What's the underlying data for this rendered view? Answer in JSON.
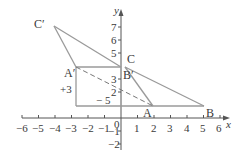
{
  "figure": {
    "type": "coordinate-geometry",
    "axes": {
      "x_label": "x",
      "y_label": "y",
      "origin_label": "0",
      "x_ticks": [
        "−6",
        "−5",
        "−4",
        "−3",
        "−2",
        "−1",
        "1",
        "2",
        "3",
        "4",
        "5",
        "6"
      ],
      "y_ticks": [
        "7",
        "6",
        "5",
        "3",
        "2",
        "−1",
        "−2"
      ]
    },
    "points": {
      "A": "A",
      "B": "B",
      "C": "C",
      "A_prime": "A′",
      "B_prime": "B′",
      "C_prime": "C′"
    },
    "annotations": {
      "horizontal_shift": "− 5",
      "vertical_shift": "+3"
    },
    "colors": {
      "line": "#9a9a9a",
      "axis": "#555555",
      "text": "#3a3a3a"
    }
  }
}
